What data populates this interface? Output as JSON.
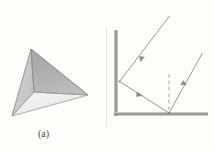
{
  "figure": {
    "panels": [
      {
        "id": "a",
        "caption": "(a)",
        "subject": "shaded-tetrahedron",
        "shape": {
          "type": "tetrahedron",
          "vertices": {
            "top": [
              31,
              49
            ],
            "right": [
              88,
              95
            ],
            "bottom_left": [
              12,
              116
            ],
            "inner": [
              34,
              92
            ]
          },
          "faces": [
            {
              "name": "upper-right-face",
              "fill": "#aaaaaa",
              "points": "31,49 88,95 34,92"
            },
            {
              "name": "left-face",
              "fill": "#cfcfcf",
              "points": "31,49 34,92 12,116"
            },
            {
              "name": "bottom-face",
              "fill": "#efefef",
              "points": "34,92 88,95 12,116"
            }
          ],
          "edge_color": "#8a8a8a"
        }
      },
      {
        "id": "b",
        "caption": "(b)",
        "subject": "two-mirror-reflection-ray-diagram",
        "mirrors": [
          {
            "label": "M",
            "sub": "1",
            "orientation": "vertical",
            "color": "#9a9a9a",
            "from": [
              116,
              30
            ],
            "to": [
              116,
              116
            ]
          },
          {
            "label": "M",
            "sub": "2",
            "orientation": "horizontal",
            "color": "#9a9a9a",
            "from": [
              113,
              114
            ],
            "to": [
              208,
              114
            ]
          }
        ],
        "points": [
          {
            "label": "A",
            "role": "incident-ray-origin",
            "x": 163,
            "y": 4
          },
          {
            "label": "B",
            "role": "first-reflection-point",
            "x": 125,
            "y": 64
          },
          {
            "label": "C",
            "role": "second-reflection-point",
            "x": 170,
            "y": 116
          },
          {
            "label": "D",
            "role": "outgoing-ray-end",
            "x": 197,
            "y": 42
          }
        ],
        "rays": [
          {
            "name": "incident-ray-A-to-B",
            "from": [
              168,
              18
            ],
            "to": [
              120,
              81
            ],
            "arrow_at": 0.55
          },
          {
            "name": "reflected-ray-B-to-C",
            "from": [
              120,
              81
            ],
            "to": [
              169,
              113
            ],
            "arrow_at": 0.45
          },
          {
            "name": "reflected-ray-C-to-D",
            "from": [
              169,
              113
            ],
            "to": [
              202,
              54
            ],
            "arrow_at": 0.52
          }
        ],
        "normal_line": {
          "name": "normal-at-C",
          "style": "dashed",
          "from": [
            169,
            76
          ],
          "to": [
            169,
            112
          ],
          "color": "#a0a0a0"
        },
        "ray_color": "#8d8d8d"
      }
    ]
  },
  "colors": {
    "page_background": "#fdfdfc",
    "mirror_gray": "#9a9a9a",
    "ray_gray": "#8d8d8d",
    "label_text": "#3d3d3d",
    "caption_text": "#4a4a4a",
    "face_dark": "#aaaaaa",
    "face_mid": "#cfcfcf",
    "face_light": "#efefef"
  }
}
